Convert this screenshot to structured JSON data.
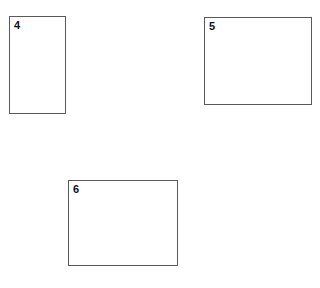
{
  "page": {
    "background_color": "#ffffff",
    "border_color": "#5a5a5a",
    "label_color": "#111111"
  },
  "figures": [
    {
      "label": "4",
      "orientation": "portrait",
      "fill": "empty"
    },
    {
      "label": "5",
      "orientation": "landscape",
      "fill": "empty"
    },
    {
      "label": "6",
      "orientation": "landscape",
      "fill": "empty"
    }
  ]
}
